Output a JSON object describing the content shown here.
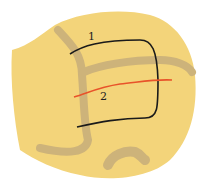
{
  "diagram": {
    "labels": [
      {
        "id": "1",
        "text": "1"
      },
      {
        "id": "2",
        "text": "2"
      }
    ],
    "colors": {
      "background": "#ffffff",
      "organ": "#f3d47a",
      "vessel": "#cdb37a",
      "incision_1": "#1a1a1a",
      "incision_2": "#e8532a"
    }
  }
}
